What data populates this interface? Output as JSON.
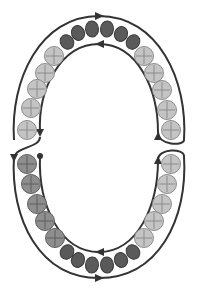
{
  "diagram": {
    "title": "",
    "colors": {
      "background": "#ffffff",
      "line": "#333333",
      "dark_bead": "#5a5a5a",
      "dark_bead_stroke": "#3a3a3a",
      "light_bead": "#c4c4c4",
      "light_bead_stroke": "#8c8c8c",
      "medium_bead": "#8e8e8e",
      "medium_bead_stroke": "#5e5e5e",
      "cross": "#7a7a7a"
    },
    "upper_arch": {
      "outer_arrow_direction": "right",
      "inner_arrow_direction": "left",
      "dark_beads": [
        {
          "cx": 67,
          "cy": 42,
          "rx": 6.5,
          "ry": 7.5,
          "rot": -35
        },
        {
          "cx": 78,
          "cy": 33,
          "rx": 6.5,
          "ry": 7.5,
          "rot": -20
        },
        {
          "cx": 92,
          "cy": 29,
          "rx": 6.5,
          "ry": 8,
          "rot": -5
        },
        {
          "cx": 107,
          "cy": 29,
          "rx": 6.5,
          "ry": 8,
          "rot": 5
        },
        {
          "cx": 121,
          "cy": 34,
          "rx": 6.5,
          "ry": 7.5,
          "rot": 20
        },
        {
          "cx": 133,
          "cy": 42,
          "rx": 6.5,
          "ry": 7.5,
          "rot": 35
        }
      ],
      "left_beads": [
        {
          "cx": 54,
          "cy": 56,
          "r": 9.5,
          "shade": "light"
        },
        {
          "cx": 45,
          "cy": 73,
          "r": 9.5,
          "shade": "light"
        },
        {
          "cx": 37,
          "cy": 89,
          "r": 9.5,
          "shade": "light"
        },
        {
          "cx": 31,
          "cy": 108,
          "r": 9.5,
          "shade": "light"
        },
        {
          "cx": 27,
          "cy": 130,
          "r": 9.5,
          "shade": "light"
        }
      ],
      "right_beads": [
        {
          "cx": 144,
          "cy": 56,
          "r": 9.5,
          "shade": "light"
        },
        {
          "cx": 154,
          "cy": 73,
          "r": 9.5,
          "shade": "light"
        },
        {
          "cx": 162,
          "cy": 90,
          "r": 9.5,
          "shade": "light"
        },
        {
          "cx": 167,
          "cy": 110,
          "r": 9.5,
          "shade": "light"
        },
        {
          "cx": 171,
          "cy": 130,
          "r": 9.5,
          "shade": "light"
        }
      ]
    },
    "lower_arch": {
      "outer_arrow_direction": "right",
      "inner_arrow_direction": "left",
      "dark_beads": [
        {
          "cx": 67,
          "cy": 252,
          "rx": 6.5,
          "ry": 7.5,
          "rot": 35
        },
        {
          "cx": 78,
          "cy": 260,
          "rx": 6.5,
          "ry": 7.5,
          "rot": 20
        },
        {
          "cx": 92,
          "cy": 265,
          "rx": 6.5,
          "ry": 8,
          "rot": 5
        },
        {
          "cx": 107,
          "cy": 265,
          "rx": 6.5,
          "ry": 8,
          "rot": -5
        },
        {
          "cx": 121,
          "cy": 260,
          "rx": 6.5,
          "ry": 7.5,
          "rot": -20
        },
        {
          "cx": 133,
          "cy": 252,
          "rx": 6.5,
          "ry": 7.5,
          "rot": -35
        }
      ],
      "left_beads": [
        {
          "cx": 27,
          "cy": 164,
          "r": 9.5,
          "shade": "medium"
        },
        {
          "cx": 31,
          "cy": 184,
          "r": 9.5,
          "shade": "medium"
        },
        {
          "cx": 37,
          "cy": 204,
          "r": 9.5,
          "shade": "medium"
        },
        {
          "cx": 45,
          "cy": 221,
          "r": 9.5,
          "shade": "medium"
        },
        {
          "cx": 55,
          "cy": 238,
          "r": 9.5,
          "shade": "medium"
        }
      ],
      "right_beads": [
        {
          "cx": 171,
          "cy": 164,
          "r": 9.5,
          "shade": "light"
        },
        {
          "cx": 167,
          "cy": 184,
          "r": 9.5,
          "shade": "light"
        },
        {
          "cx": 162,
          "cy": 204,
          "r": 9.5,
          "shade": "light"
        },
        {
          "cx": 154,
          "cy": 221,
          "r": 9.5,
          "shade": "light"
        },
        {
          "cx": 144,
          "cy": 238,
          "r": 9.5,
          "shade": "light"
        }
      ]
    }
  }
}
